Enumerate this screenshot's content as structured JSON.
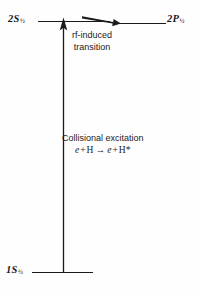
{
  "diagram": {
    "type": "atomic-energy-level-diagram",
    "background_color": "#fefefe",
    "stroke_color": "#1a1a1a",
    "levels": [
      {
        "id": "2s",
        "term": "2S",
        "subscript": "½",
        "label": "2S½",
        "energy_position": "upper-left"
      },
      {
        "id": "2p",
        "term": "2P",
        "subscript": "½",
        "label": "2P½",
        "energy_position": "upper-right"
      },
      {
        "id": "1s",
        "term": "1S",
        "subscript": "½",
        "label": "1S½",
        "energy_position": "ground"
      }
    ],
    "transitions": [
      {
        "id": "rf-transition",
        "caption_line1": "rf-induced",
        "caption_line2": "transition",
        "direction": "2S½ → 2P½",
        "arrow": "horizontal-right"
      },
      {
        "id": "collisional-excitation",
        "caption_line1": "Collisional excitation",
        "equation": "e + H → e + H*",
        "equation_parts": {
          "e1": "e",
          "plus1": "+",
          "h1": "H",
          "arrow": "→",
          "e2": "e",
          "plus2": "+",
          "h2": "H*"
        },
        "direction": "1S½ → 2S½",
        "arrow": "vertical-up"
      }
    ]
  }
}
